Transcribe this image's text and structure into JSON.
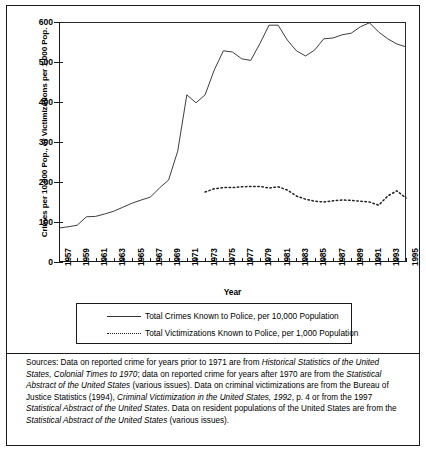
{
  "figure": {
    "xaxis_title": "Year",
    "yaxis_title": "Crimes per 10,000 Pop., or Victimizations per 1,000 Pop."
  },
  "legend": {
    "items": [
      {
        "label": "Total Crimes Known to Police, per 10,000 Population",
        "style": "solid",
        "icon": "solid-line-icon"
      },
      {
        "label": "Total Victimizations Known to Police, per 1,000 Population",
        "style": "dotted",
        "icon": "dotted-line-icon"
      }
    ]
  },
  "source": {
    "prefix": "Sources:",
    "text": "  Data on reported crime for years prior to 1971 are from ",
    "title1": "Historical Statistics of the United States, Colonial Times to 1970",
    "text2": "; data on reported crime for years after 1970 are from the ",
    "title2": "Statistical Abstract of the United States",
    "text3": " (various issues).  Data on criminal victimizations are from the Bureau of Justice Statistics (1994), ",
    "title3": "Criminal Victimization in the United States, 1992",
    "text4": ", p. 4 or from the 1997 ",
    "title4": "Statistical Abstract of the United States",
    "text5": ".  Data on resident populations of the United States are from the ",
    "title5": "Statistical Abstract of the United States",
    "text6": " (various issues)."
  },
  "chart_data": {
    "type": "line",
    "title": "",
    "xlabel": "Year",
    "ylabel": "Crimes per 10,000 Pop., or Victimizations per 1,000 Pop.",
    "xlim": [
      1957,
      1995
    ],
    "ylim": [
      0,
      600
    ],
    "yticks": [
      0,
      100,
      200,
      300,
      400,
      500,
      600
    ],
    "xticks": [
      1957,
      1959,
      1961,
      1963,
      1965,
      1967,
      1969,
      1971,
      1973,
      1975,
      1977,
      1979,
      1981,
      1983,
      1985,
      1987,
      1989,
      1991,
      1993,
      1995
    ],
    "xtick_labels": [
      "1957",
      "1959",
      "1961",
      "1963",
      "1965",
      "1967",
      "1969",
      "1971",
      "1973",
      "1975",
      "1977",
      "1979",
      "1981",
      "1983",
      "1985",
      "1987",
      "1989",
      "1991",
      "1993",
      "1995"
    ],
    "grid": false,
    "legend_position": "below",
    "series": [
      {
        "name": "Total Crimes Known to Police, per 10,000 Population",
        "style": "solid",
        "color": "#333333",
        "x": [
          1957,
          1958,
          1959,
          1960,
          1961,
          1962,
          1963,
          1964,
          1965,
          1966,
          1967,
          1968,
          1969,
          1970,
          1971,
          1972,
          1973,
          1974,
          1975,
          1976,
          1977,
          1978,
          1979,
          1980,
          1981,
          1982,
          1983,
          1984,
          1985,
          1986,
          1987,
          1988,
          1989,
          1990,
          1991,
          1992,
          1993,
          1994,
          1995
        ],
        "values": [
          85,
          88,
          92,
          113,
          114,
          120,
          127,
          137,
          147,
          155,
          162,
          185,
          205,
          277,
          418,
          398,
          418,
          480,
          528,
          525,
          508,
          504,
          546,
          592,
          592,
          555,
          528,
          515,
          530,
          558,
          560,
          568,
          572,
          588,
          598,
          575,
          558,
          545,
          538
        ]
      },
      {
        "name": "Total Victimizations Known to Police, per 1,000 Population",
        "style": "dotted",
        "color": "#222222",
        "x": [
          1973,
          1974,
          1975,
          1976,
          1977,
          1978,
          1979,
          1980,
          1981,
          1982,
          1983,
          1984,
          1985,
          1986,
          1987,
          1988,
          1989,
          1990,
          1991,
          1992,
          1993,
          1994,
          1995
        ],
        "values": [
          175,
          183,
          186,
          186,
          188,
          189,
          189,
          185,
          188,
          180,
          165,
          157,
          152,
          150,
          153,
          155,
          154,
          152,
          150,
          142,
          165,
          178,
          160
        ]
      }
    ]
  }
}
